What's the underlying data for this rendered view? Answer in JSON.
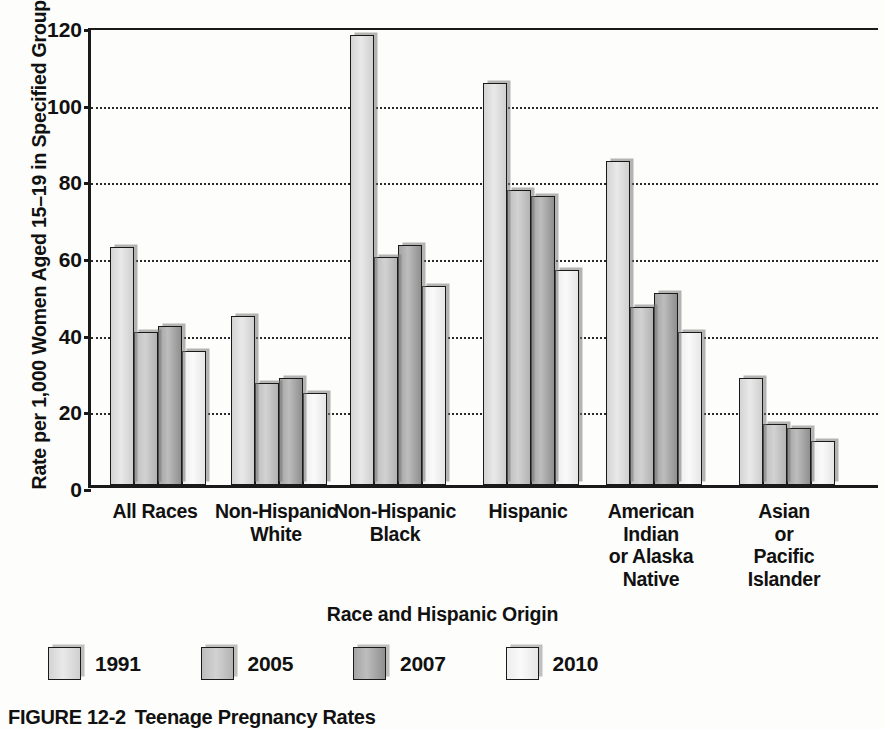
{
  "chart_data": {
    "type": "bar",
    "title": "",
    "xlabel": "Race and Hispanic Origin",
    "ylabel": "Rate per 1,000 Women Aged 15–19 in Specified Group",
    "ylim": [
      0,
      120
    ],
    "yticks": [
      0,
      20,
      40,
      60,
      80,
      100,
      120
    ],
    "ytick_labels": [
      "0",
      "20",
      "40",
      "60",
      "80",
      "100",
      "120"
    ],
    "grid": "horizontal-dotted",
    "legend_position": "below-plot-left",
    "categories": [
      "All Races",
      "Non-Hispanic\nWhite",
      "Non-Hispanic\nBlack",
      "Hispanic",
      "American\nIndian\nor Alaska\nNative",
      "Asian\nor\nPacific\nIslander"
    ],
    "category_lines": [
      [
        "All Races"
      ],
      [
        "Non-Hispanic",
        "White"
      ],
      [
        "Non-Hispanic",
        "Black"
      ],
      [
        "Hispanic"
      ],
      [
        "American",
        "Indian",
        "or Alaska",
        "Native"
      ],
      [
        "Asian",
        "or",
        "Pacific",
        "Islander"
      ]
    ],
    "series": [
      {
        "name": "1991",
        "values": [
          62,
          44,
          117.5,
          105,
          84.5,
          28
        ]
      },
      {
        "name": "2005",
        "values": [
          40,
          26.5,
          59.5,
          77,
          46.5,
          16
        ]
      },
      {
        "name": "2007",
        "values": [
          41.5,
          28,
          62.5,
          75.5,
          50,
          15
        ]
      },
      {
        "name": "2010",
        "values": [
          35,
          24,
          52,
          56,
          40,
          11.5
        ]
      }
    ]
  },
  "legend": {
    "items": [
      {
        "label": "1991",
        "series_index": 0
      },
      {
        "label": "2005",
        "series_index": 1
      },
      {
        "label": "2007",
        "series_index": 2
      },
      {
        "label": "2010",
        "series_index": 3
      }
    ]
  },
  "caption": {
    "figure_number": "FIGURE 12-2",
    "figure_title": "Teenage Pregnancy Rates"
  }
}
